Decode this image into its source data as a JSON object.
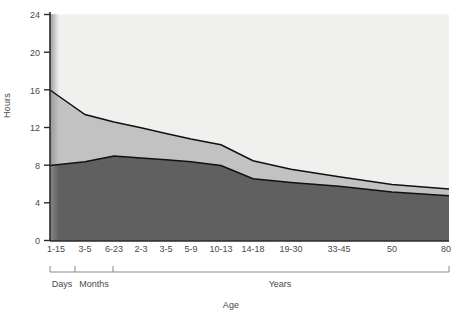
{
  "chart_data": {
    "type": "area",
    "title": "",
    "xlabel": "Age",
    "ylabel": "Hours",
    "ylim": [
      0,
      24
    ],
    "yticks": [
      0,
      4,
      8,
      12,
      16,
      20,
      24
    ],
    "grid": false,
    "legend_position": "inline-annotations",
    "stacked": true,
    "categories": [
      "1-15",
      "3-5",
      "6-23",
      "2-3",
      "3-5",
      "5-9",
      "10-13",
      "14-18",
      "19-30",
      "33-45",
      "50",
      "80"
    ],
    "category_units": [
      "Days",
      "Months",
      "Months",
      "Years",
      "Years",
      "Years",
      "Years",
      "Years",
      "Years",
      "Years",
      "Years",
      "Years"
    ],
    "series": [
      {
        "name": "Non REM sleep",
        "color": "#606060",
        "values": [
          8.0,
          8.4,
          9.0,
          8.8,
          8.6,
          8.4,
          8.0,
          6.6,
          6.2,
          5.8,
          5.2,
          4.8
        ]
      },
      {
        "name": "REM sleep",
        "color": "#c2c2c2",
        "values": [
          8.0,
          5.0,
          3.6,
          3.2,
          2.8,
          2.4,
          2.2,
          1.9,
          1.4,
          1.0,
          0.8,
          0.7
        ]
      },
      {
        "name": "Awake",
        "color": "#f0f0ee",
        "values": [
          8.0,
          10.6,
          11.4,
          12.0,
          12.6,
          13.2,
          13.8,
          15.5,
          16.4,
          17.2,
          18.0,
          18.5
        ]
      }
    ],
    "total_sleep_hours": [
      16.0,
      13.4,
      12.6,
      12.0,
      11.4,
      10.8,
      10.2,
      8.5,
      7.6,
      6.8,
      6.0,
      5.5
    ],
    "annotations": [
      {
        "name": "awake",
        "text": "Awake"
      },
      {
        "name": "rem",
        "text": "REM sleep"
      },
      {
        "name": "nonrem",
        "text": "Non REM sleep"
      }
    ],
    "axis_groups": [
      {
        "label": "Days",
        "from_category": "1-15",
        "to_category": "1-15"
      },
      {
        "label": "Months",
        "from_category": "3-5",
        "to_category": "6-23"
      },
      {
        "label": "Years",
        "from_category": "2-3",
        "to_category": "80"
      }
    ]
  },
  "axes": {
    "y_title": "Hours",
    "x_title": "Age",
    "y_ticks": [
      "0",
      "4",
      "8",
      "12",
      "16",
      "20",
      "24"
    ],
    "x_ticks": [
      "1-15",
      "3-5",
      "6-23",
      "2-3",
      "3-5",
      "5-9",
      "10-13",
      "14-18",
      "19-30",
      "33-45",
      "50",
      "80"
    ],
    "group_labels": [
      "Days",
      "Months",
      "Years"
    ]
  },
  "labels": {
    "awake": "Awake",
    "rem": "REM sleep",
    "nonrem": "Non REM sleep"
  },
  "colors": {
    "awake": "#f0f0ee",
    "rem": "#c2c2c2",
    "nonrem": "#606060",
    "line": "#111111",
    "axis": "#2b2b2b",
    "text": "#4a4a4a"
  }
}
